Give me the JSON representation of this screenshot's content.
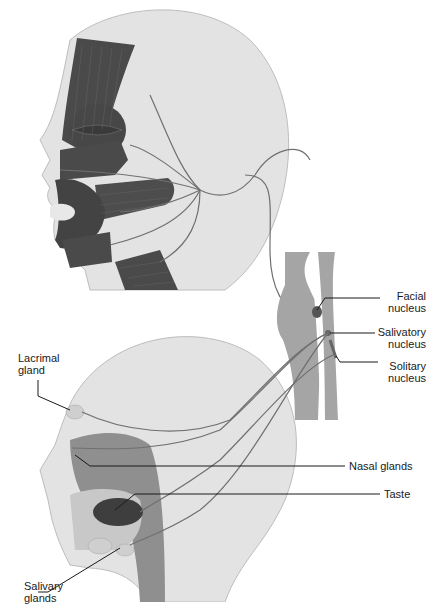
{
  "diagram": {
    "colors": {
      "skin": "#e3e3e3",
      "skin_outline": "#bdbdbd",
      "muscle": "#4a4a4a",
      "nerve": "#707070",
      "cavity": "#8f8f8f",
      "brainstem": "#a5a5a5",
      "leader_line": "#1a1a1a"
    },
    "labels": {
      "facial_nucleus": [
        "Facial",
        "nucleus"
      ],
      "salivatory_nucleus": [
        "Salivatory",
        "nucleus"
      ],
      "solitary_nucleus": [
        "Solitary",
        "nucleus"
      ],
      "lacrimal_gland": [
        "Lacrimal",
        "gland"
      ],
      "nasal_glands": "Nasal glands",
      "taste": "Taste",
      "salivary_glands": [
        "Salivary",
        "glands"
      ]
    }
  }
}
